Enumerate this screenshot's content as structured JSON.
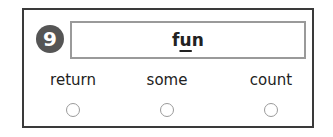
{
  "question": {
    "number": "9",
    "word_parts": {
      "before": "f",
      "underlined": "u",
      "after": "n"
    },
    "word": "fun"
  },
  "options": [
    {
      "label": "return",
      "selected": false
    },
    {
      "label": "some",
      "selected": false
    },
    {
      "label": "count",
      "selected": false
    }
  ],
  "colors": {
    "badge": "#555555",
    "border": "#3a3a3a",
    "word_box_border": "#9a9a9a"
  }
}
